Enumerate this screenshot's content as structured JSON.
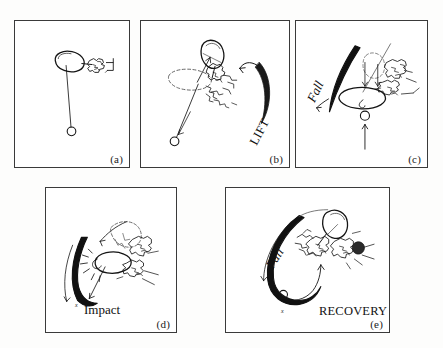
{
  "figure": {
    "title": "",
    "background_color": "#fdfdfc",
    "ink_color": "#111111",
    "frame_color": "#3a3a3a",
    "panels": [
      {
        "id": "a",
        "label": "(a)",
        "annotations": [],
        "description": "Line drawing: implement head (oval) held by sketchy hand at upper right, long cord descending to small open circle (ball) at lower centre"
      },
      {
        "id": "b",
        "label": "(b)",
        "annotations": [
          {
            "name": "lift",
            "text": "LIFT",
            "rotation_deg": -62
          }
        ],
        "description": "Implement raised, ghosted previous position dashed, cord and ball swinging down-left with motion arrow; large curved arrow at right labelled LIFT"
      },
      {
        "id": "c",
        "label": "(c)",
        "annotations": [
          {
            "name": "fall",
            "text": "Fall",
            "rotation_deg": -64
          }
        ],
        "description": "Implement swung down to horizontal, thick black arc at left labelled Fall, ball below head with upward arrow"
      },
      {
        "id": "d",
        "label": "(d)",
        "annotations": [
          {
            "name": "impact",
            "text": "Impact",
            "rotation_deg": 0
          },
          {
            "name": "impact-x-marker",
            "text": "x",
            "rotation_deg": 0
          }
        ],
        "description": "Implement head striking target, thick black arc sweeping down-left ending at an x marker labelled Impact"
      },
      {
        "id": "e",
        "label": "(e)",
        "annotations": [
          {
            "name": "fall",
            "text": "Fall",
            "rotation_deg": -58
          },
          {
            "name": "recovery",
            "text": "RECOVERY",
            "rotation_deg": 0
          },
          {
            "name": "recovery-x-marker",
            "text": "x",
            "rotation_deg": 0
          }
        ],
        "description": "Thick black hook-shaped arc from upper right sweeping down and around to the right; Fall labels the descending limb, RECOVERY labels the rising limb returning toward the figure"
      }
    ]
  }
}
